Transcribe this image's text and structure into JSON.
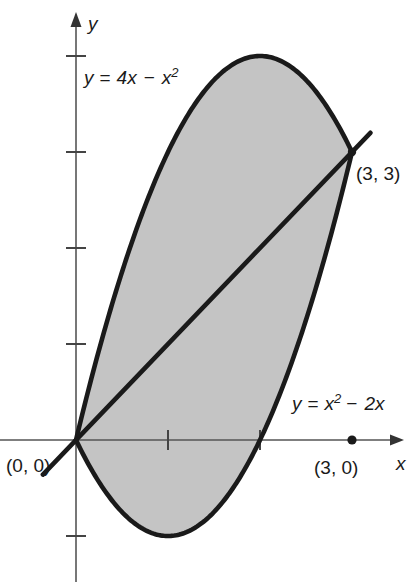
{
  "figure": {
    "background_color": "#ffffff",
    "shade_color": "#c4c4c4",
    "curve_color": "#1a1a1a",
    "axis_color": "#555555"
  },
  "axes": {
    "x_label": "x",
    "y_label": "y",
    "origin_px": {
      "x": 76,
      "y": 440
    },
    "unit_px": {
      "x": 92,
      "y": 96
    },
    "x_ticks": [
      1,
      2
    ],
    "y_ticks": [
      1,
      2,
      3,
      4
    ],
    "x_range": [
      -0.8,
      3.6
    ],
    "y_range": [
      -1.5,
      4.2
    ]
  },
  "chart_data": {
    "type": "line",
    "xlabel": "x",
    "ylabel": "y",
    "xlim": [
      -0.8,
      3.6
    ],
    "ylim": [
      -1.5,
      4.2
    ],
    "grid": false,
    "legend": "inline-annotations",
    "series": [
      {
        "name": "y = 4x - x^2",
        "label": "y = 4x − x²",
        "kind": "parabola",
        "coefficients": {
          "a": -1,
          "b": 4,
          "c": 0
        },
        "vertex": [
          2,
          4
        ],
        "x_domain": [
          0,
          3
        ],
        "points": [
          [
            0,
            0
          ],
          [
            0.25,
            0.9375
          ],
          [
            0.5,
            1.75
          ],
          [
            0.75,
            2.4375
          ],
          [
            1,
            3
          ],
          [
            1.25,
            3.4375
          ],
          [
            1.5,
            3.75
          ],
          [
            1.75,
            3.9375
          ],
          [
            2,
            4
          ],
          [
            2.25,
            3.9375
          ],
          [
            2.5,
            3.75
          ],
          [
            2.75,
            3.4375
          ],
          [
            3,
            3
          ]
        ]
      },
      {
        "name": "y = x^2 - 2x",
        "label": "y = x² − 2x",
        "kind": "parabola",
        "coefficients": {
          "a": 1,
          "b": -2,
          "c": 0
        },
        "vertex": [
          1,
          -1
        ],
        "x_domain": [
          0,
          3
        ],
        "roots": [
          0,
          2
        ],
        "points": [
          [
            0,
            0
          ],
          [
            0.25,
            -0.4375
          ],
          [
            0.5,
            -0.75
          ],
          [
            0.75,
            -0.9375
          ],
          [
            1,
            -1
          ],
          [
            1.25,
            -0.9375
          ],
          [
            1.5,
            -0.75
          ],
          [
            1.75,
            -0.4375
          ],
          [
            2,
            0
          ],
          [
            2.25,
            0.5625
          ],
          [
            2.5,
            1.25
          ],
          [
            2.75,
            2.0625
          ],
          [
            3,
            3
          ]
        ]
      },
      {
        "name": "line through intersections",
        "label": "",
        "kind": "line",
        "slope": 1,
        "intercept": 0,
        "x_domain": [
          -0.36,
          3.2
        ],
        "points": [
          [
            -0.36,
            -0.36
          ],
          [
            3.2,
            3.2
          ]
        ]
      }
    ],
    "shaded_region": {
      "between": [
        "y = 4x - x^2",
        "y = x^2 - 2x"
      ],
      "x_from": 0,
      "x_to": 3,
      "color": "#c4c4c4"
    },
    "annotations": [
      {
        "text": "y = 4x − x²",
        "x_px": 84,
        "y_px": 78
      },
      {
        "text": "y = x² − 2x",
        "x_px": 292,
        "y_px": 404
      },
      {
        "text": "(0, 0)",
        "x_px": 6,
        "y_px": 470
      },
      {
        "text": "(3, 3)",
        "x_px": 356,
        "y_px": 176
      },
      {
        "text": "(3, 0)",
        "x_px": 316,
        "y_px": 472
      }
    ],
    "marked_points": [
      {
        "label": "(0, 0)",
        "x": 0,
        "y": 0,
        "marker": "intersection"
      },
      {
        "label": "(3, 3)",
        "x": 3,
        "y": 3,
        "marker": "dot"
      },
      {
        "label": "(3, 0)",
        "x": 3,
        "y": 0,
        "marker": "dot"
      }
    ]
  },
  "labels": {
    "upper_curve": "y = 4x − x²",
    "lower_curve": "y = x² − 2x",
    "origin_point": "(0, 0)",
    "upper_intersection": "(3, 3)",
    "x_axis_point": "(3, 0)",
    "x_axis_name": "x",
    "y_axis_name": "y"
  },
  "equation_parts": {
    "upper": {
      "lhs": "y",
      "eq": "=",
      "term1": "4x",
      "minus": "−",
      "term2": "x",
      "exp2": "2"
    },
    "lower": {
      "lhs": "y",
      "eq": "=",
      "term1": "x",
      "exp1": "2",
      "minus": "−",
      "term2": "2x"
    }
  }
}
